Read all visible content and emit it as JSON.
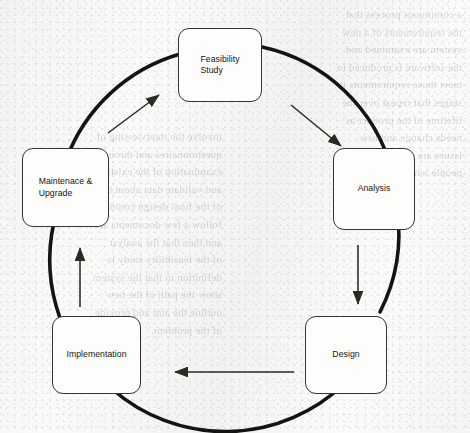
{
  "diagram": {
    "type": "cyclic-process-diagram",
    "flow_direction": "clockwise",
    "colors": {
      "page_background": "#f6f6f5",
      "circle_stroke": "#141410",
      "arrow_stroke": "#2a2a24",
      "box_fill": "#fdfdfc",
      "box_border": "#34352f",
      "text": "#15150f"
    },
    "geometry": {
      "center_x": 225,
      "center_y": 222,
      "radius": 172,
      "circle_stroke_width": 3.6
    },
    "stages": [
      {
        "id": "feasibility-study",
        "label": "Feasibility\nStudy",
        "position": "top",
        "order": 1
      },
      {
        "id": "analysis",
        "label": "Analysis",
        "position": "right",
        "order": 2
      },
      {
        "id": "design",
        "label": "Design",
        "position": "bottom-right",
        "order": 3
      },
      {
        "id": "implementation",
        "label": "Implementation",
        "position": "bottom-left",
        "order": 4
      },
      {
        "id": "maintenance-upgrade",
        "label": "Maintenace &\nUpgrade",
        "position": "left",
        "order": 5
      }
    ],
    "arrows": [
      {
        "id": "arrow-feasibility-to-analysis",
        "from": "feasibility-study",
        "to": "analysis",
        "direction": "down-right"
      },
      {
        "id": "arrow-analysis-to-design",
        "from": "analysis",
        "to": "design",
        "direction": "down"
      },
      {
        "id": "arrow-design-to-implementation",
        "from": "design",
        "to": "implementation",
        "direction": "left"
      },
      {
        "id": "arrow-implementation-to-maintenance",
        "from": "implementation",
        "to": "maintenance-upgrade",
        "direction": "up"
      },
      {
        "id": "arrow-maintenance-to-feasibility",
        "from": "maintenance-upgrade",
        "to": "feasibility-study",
        "direction": "up-right"
      }
    ]
  },
  "background_artifact": {
    "kind": "scan-bleed-through",
    "legible": false,
    "description": "Faint mirrored text showing through from the reverse side of the scanned page",
    "left_column_text": "a continuous process that\nthe requirements of a new\nsystem are examined and\nthe software is produced to\nmeet those requirements in\nstages that repeat over the\nlifetime of the product as\nneeds change and new\nissues are discovered by the\npeople who use it.",
    "right_column_text": "involve the interviewing of\nquestionnaires and through\nexamination of the existing\nand validate data about the\nof the final design could be\nfollow a few documents are\nand then that the analyst\nof the feasibility study is\ndefinition in that the system\nshow the path of the new\noutline the aim and provide\nof the problem."
  }
}
